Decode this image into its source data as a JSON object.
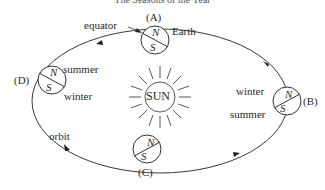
{
  "title": "The Seasons of the Year",
  "labels": {
    "equator": "equator",
    "earth": "Earth",
    "orbit": "orbit",
    "sun": "SUN",
    "north": "N",
    "south": "S"
  },
  "positions": [
    {
      "id": "A",
      "label": "(A)"
    },
    {
      "id": "B",
      "label": "(B)",
      "top_season": "winter",
      "bottom_season": "summer"
    },
    {
      "id": "C",
      "label": "(C)"
    },
    {
      "id": "D",
      "label": "(D)",
      "top_season": "summer",
      "bottom_season": "winter"
    }
  ],
  "colors": {
    "stroke": "#3a3a3a",
    "background": "#ffffff"
  }
}
